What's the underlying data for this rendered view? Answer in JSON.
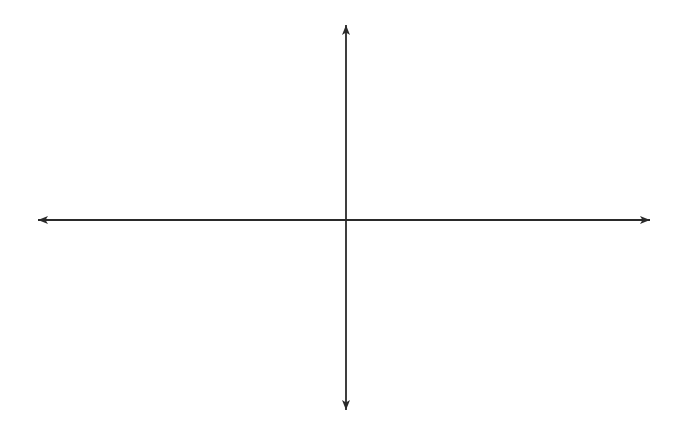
{
  "figure": {
    "type": "parabola-reflection-diagram",
    "axes": {
      "x_label": "x",
      "y_label": "y"
    },
    "grid": {
      "columns": 20,
      "rows": 12,
      "columns_left_of_y_axis": 10,
      "rows_above_x_axis": 6,
      "line_color": "#2b2b2b"
    },
    "curve": {
      "description": "parabola opening to the right with vertex at origin",
      "equation_form": "x = k*y^2",
      "vertex": [
        0,
        0
      ],
      "ends_with_arrows": true,
      "color": "#2a2a2a"
    },
    "arrows": {
      "direction": "left",
      "target": "y-axis",
      "upper": [
        {
          "y_units": 3.1,
          "reach_units": 9.7,
          "style": "dashed"
        },
        {
          "y_units": 2.6,
          "reach_units": 5.6,
          "style": "dashed"
        },
        {
          "y_units": 2.0,
          "reach_units": 4.0,
          "style": "solid"
        },
        {
          "y_units": 1.45,
          "reach_units": 1.6,
          "style": "solid-dashed"
        },
        {
          "y_units": 0.9,
          "reach_units": 0.3,
          "style": "solid"
        }
      ],
      "lower": [
        {
          "y_units": -0.5,
          "reach_units": 0.2,
          "style": "solid"
        },
        {
          "y_units": -1.0,
          "reach_units": 1.0,
          "style": "solid"
        },
        {
          "y_units": -1.4,
          "reach_units": 2.6,
          "style": "solid-dashed"
        },
        {
          "y_units": -2.1,
          "reach_units": 5.2,
          "style": "solid-dashed"
        },
        {
          "y_units": -2.75,
          "reach_units": 9.7,
          "style": "dashed"
        }
      ]
    }
  }
}
